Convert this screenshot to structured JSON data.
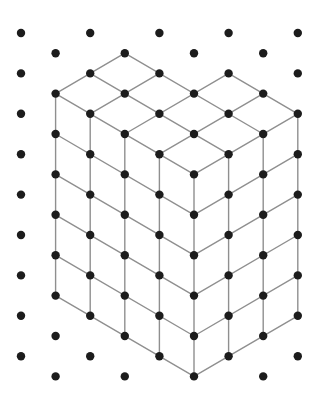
{
  "diagram": {
    "title": "Isometric dot grid with L-shaped cube stack",
    "type": "isometric-solid-drawing",
    "colors": {
      "background": "#ffffff",
      "dot": "#1c1c1c",
      "edge": "#8f8f8f"
    },
    "lattice": {
      "origin_x": 21,
      "origin_y": 33,
      "col_step": 34.6,
      "row_step": 20.2,
      "columns": 9,
      "rows": 18,
      "dot_radius": 4.2,
      "rule": "dot at (col,row) where col+row is even"
    },
    "solid": {
      "description": "Flat-topped L-shaped prism, 5 cubes tall; top footprint 4x3 minus a 2x1 back notch (10 cubes per layer)",
      "height_units": 5,
      "left_face_width_units": 4,
      "right_face_width_units": 3,
      "front_corner": [
        5,
        7
      ],
      "top_outline": [
        [
          1,
          3
        ],
        [
          3,
          1
        ],
        [
          4,
          2
        ],
        [
          5,
          3
        ],
        [
          6,
          2
        ],
        [
          8,
          4
        ],
        [
          5,
          7
        ],
        [
          1,
          3
        ]
      ],
      "segments": [
        {
          "from": [
            1,
            3
          ],
          "to": [
            5,
            7
          ],
          "part": "top"
        },
        {
          "from": [
            2,
            2
          ],
          "to": [
            6,
            6
          ],
          "part": "top"
        },
        {
          "from": [
            3,
            1
          ],
          "to": [
            7,
            5
          ],
          "part": "top"
        },
        {
          "from": [
            6,
            2
          ],
          "to": [
            8,
            4
          ],
          "part": "top"
        },
        {
          "from": [
            1,
            3
          ],
          "to": [
            3,
            1
          ],
          "part": "top"
        },
        {
          "from": [
            2,
            4
          ],
          "to": [
            4,
            2
          ],
          "part": "top"
        },
        {
          "from": [
            3,
            5
          ],
          "to": [
            6,
            2
          ],
          "part": "top"
        },
        {
          "from": [
            4,
            6
          ],
          "to": [
            7,
            3
          ],
          "part": "top"
        },
        {
          "from": [
            5,
            7
          ],
          "to": [
            8,
            4
          ],
          "part": "top"
        },
        {
          "from": [
            1,
            3
          ],
          "to": [
            1,
            13
          ],
          "part": "left-face"
        },
        {
          "from": [
            2,
            4
          ],
          "to": [
            2,
            14
          ],
          "part": "left-face"
        },
        {
          "from": [
            3,
            5
          ],
          "to": [
            3,
            15
          ],
          "part": "left-face"
        },
        {
          "from": [
            4,
            6
          ],
          "to": [
            4,
            16
          ],
          "part": "left-face"
        },
        {
          "from": [
            5,
            7
          ],
          "to": [
            5,
            17
          ],
          "part": "left-face"
        },
        {
          "from": [
            1,
            5
          ],
          "to": [
            5,
            9
          ],
          "part": "left-face"
        },
        {
          "from": [
            1,
            7
          ],
          "to": [
            5,
            11
          ],
          "part": "left-face"
        },
        {
          "from": [
            1,
            9
          ],
          "to": [
            5,
            13
          ],
          "part": "left-face"
        },
        {
          "from": [
            1,
            11
          ],
          "to": [
            5,
            15
          ],
          "part": "left-face"
        },
        {
          "from": [
            1,
            13
          ],
          "to": [
            5,
            17
          ],
          "part": "left-face"
        },
        {
          "from": [
            6,
            6
          ],
          "to": [
            6,
            16
          ],
          "part": "right-face"
        },
        {
          "from": [
            7,
            5
          ],
          "to": [
            7,
            15
          ],
          "part": "right-face"
        },
        {
          "from": [
            8,
            4
          ],
          "to": [
            8,
            14
          ],
          "part": "right-face"
        },
        {
          "from": [
            5,
            9
          ],
          "to": [
            8,
            6
          ],
          "part": "right-face"
        },
        {
          "from": [
            5,
            11
          ],
          "to": [
            8,
            8
          ],
          "part": "right-face"
        },
        {
          "from": [
            5,
            13
          ],
          "to": [
            8,
            10
          ],
          "part": "right-face"
        },
        {
          "from": [
            5,
            15
          ],
          "to": [
            8,
            12
          ],
          "part": "right-face"
        },
        {
          "from": [
            5,
            17
          ],
          "to": [
            8,
            14
          ],
          "part": "right-face"
        }
      ]
    }
  }
}
